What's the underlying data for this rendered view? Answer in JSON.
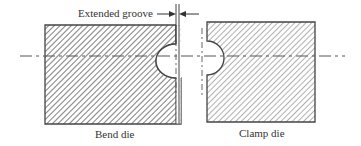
{
  "diagram": {
    "labels": {
      "extended_groove": "Extended groove",
      "bend_die": "Bend die",
      "clamp_die": "Clamp die"
    },
    "colors": {
      "line": "#444444",
      "hatch": "#777777",
      "background": "#ffffff"
    }
  }
}
